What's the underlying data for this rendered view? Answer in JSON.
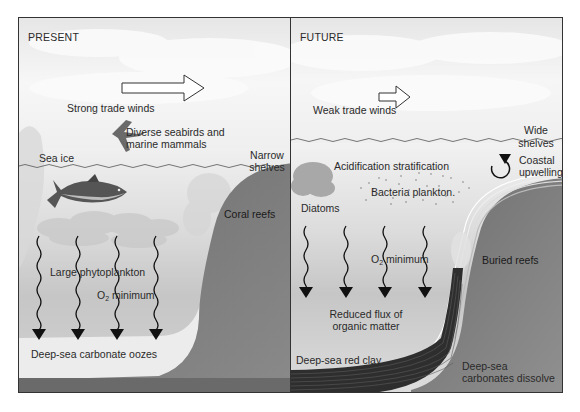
{
  "present": {
    "title": "PRESENT",
    "wind_label": "Strong trade winds",
    "birds_label_line1": "Diverse seabirds and",
    "birds_label_line2": "marine mammals",
    "shelves_line1": "Narrow",
    "shelves_line2": "shelves",
    "sea_ice": "Sea ice",
    "coral_reefs": "Coral reefs",
    "phytoplankton": "Large phytoplankton",
    "o2_prefix": "O",
    "o2_sub": "2",
    "o2_suffix": " minimum",
    "sediment": "Deep-sea carbonate oozes"
  },
  "future": {
    "title": "FUTURE",
    "wind_label": "Weak trade winds",
    "shelves_line1": "Wide",
    "shelves_line2": "shelves",
    "acidification": "Acidification stratification",
    "upwelling_line1": "Coastal",
    "upwelling_line2": "upwelling",
    "bacteria": "Bacteria plankton.",
    "diatoms": "Diatoms",
    "o2_prefix": "O",
    "o2_sub": "2",
    "o2_suffix": " minimum",
    "buried_reefs": "Buried reefs",
    "flux_line1": "Reduced flux of",
    "flux_line2": "organic matter",
    "red_clay": "Deep-sea red clay",
    "dissolve_line1": "Deep-sea",
    "dissolve_line2": "carbonates dissolve"
  },
  "colors": {
    "sky": "#f2f2f2",
    "water_top": "#ebebeb",
    "water_deep": "#c4c4c4",
    "shelf_rock": "#777777",
    "sediment_light": "#e4e4e4",
    "sediment_dark": "#3a3a3a",
    "border": "#333333"
  }
}
